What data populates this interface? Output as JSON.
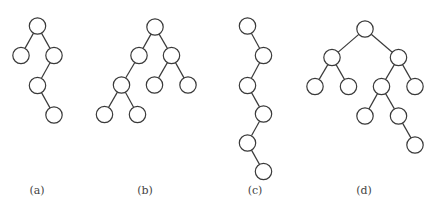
{
  "figure": {
    "node_radius": 8.2,
    "colors": {
      "stroke": "#3a3a3a",
      "fill": "#ffffff",
      "caption": "#444444"
    },
    "trees": [
      {
        "id": "a",
        "caption": "(a)",
        "caption_pos": [
          37,
          194
        ],
        "nodes": [
          {
            "id": "root",
            "x": 37.5,
            "y": 26
          },
          {
            "id": "L",
            "x": 21,
            "y": 55.5
          },
          {
            "id": "R",
            "x": 54,
            "y": 55.5
          },
          {
            "id": "RL",
            "x": 37.5,
            "y": 85.5
          },
          {
            "id": "RLR",
            "x": 54,
            "y": 115
          }
        ],
        "edges": [
          [
            "root",
            "L"
          ],
          [
            "root",
            "R"
          ],
          [
            "R",
            "RL"
          ],
          [
            "RL",
            "RLR"
          ]
        ]
      },
      {
        "id": "b",
        "caption": "(b)",
        "caption_pos": [
          145,
          194
        ],
        "nodes": [
          {
            "id": "root",
            "x": 155,
            "y": 27
          },
          {
            "id": "L",
            "x": 139,
            "y": 55.5
          },
          {
            "id": "R",
            "x": 171.5,
            "y": 55.5
          },
          {
            "id": "LL",
            "x": 121.5,
            "y": 85
          },
          {
            "id": "RL",
            "x": 154.5,
            "y": 85
          },
          {
            "id": "RR",
            "x": 188,
            "y": 85
          },
          {
            "id": "LLL",
            "x": 104.5,
            "y": 114.5
          },
          {
            "id": "LLR",
            "x": 137.5,
            "y": 114.5
          }
        ],
        "edges": [
          [
            "root",
            "L"
          ],
          [
            "root",
            "R"
          ],
          [
            "L",
            "LL"
          ],
          [
            "R",
            "RL"
          ],
          [
            "R",
            "RR"
          ],
          [
            "LL",
            "LLL"
          ],
          [
            "LL",
            "LLR"
          ]
        ]
      },
      {
        "id": "c",
        "caption": "(c)",
        "caption_pos": [
          255,
          194
        ],
        "nodes": [
          {
            "id": "n1",
            "x": 247.5,
            "y": 26
          },
          {
            "id": "n2",
            "x": 263.5,
            "y": 55.5
          },
          {
            "id": "n3",
            "x": 247.5,
            "y": 85.5
          },
          {
            "id": "n4",
            "x": 263.5,
            "y": 114
          },
          {
            "id": "n5",
            "x": 247.5,
            "y": 143
          },
          {
            "id": "n6",
            "x": 263.5,
            "y": 171.5
          }
        ],
        "edges": [
          [
            "n1",
            "n2"
          ],
          [
            "n2",
            "n3"
          ],
          [
            "n3",
            "n4"
          ],
          [
            "n4",
            "n5"
          ],
          [
            "n5",
            "n6"
          ]
        ]
      },
      {
        "id": "d",
        "caption": "(d)",
        "caption_pos": [
          364,
          194
        ],
        "nodes": [
          {
            "id": "root",
            "x": 365,
            "y": 29
          },
          {
            "id": "L",
            "x": 332,
            "y": 57.5
          },
          {
            "id": "R",
            "x": 398.5,
            "y": 57.5
          },
          {
            "id": "LL",
            "x": 315,
            "y": 86.5
          },
          {
            "id": "LR",
            "x": 348.5,
            "y": 86.5
          },
          {
            "id": "RL",
            "x": 381.5,
            "y": 86.5
          },
          {
            "id": "RR",
            "x": 415,
            "y": 86.5
          },
          {
            "id": "RLL",
            "x": 365,
            "y": 116
          },
          {
            "id": "RLR",
            "x": 398.5,
            "y": 116
          },
          {
            "id": "RLRR",
            "x": 415,
            "y": 145
          }
        ],
        "edges": [
          [
            "root",
            "L"
          ],
          [
            "root",
            "R"
          ],
          [
            "L",
            "LL"
          ],
          [
            "L",
            "LR"
          ],
          [
            "R",
            "RL"
          ],
          [
            "R",
            "RR"
          ],
          [
            "RL",
            "RLL"
          ],
          [
            "RL",
            "RLR"
          ],
          [
            "RLR",
            "RLRR"
          ]
        ]
      }
    ]
  }
}
